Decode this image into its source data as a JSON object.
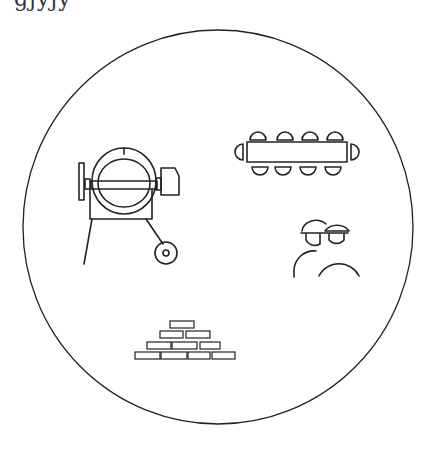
{
  "header": {
    "clipped_text": "gjyjy"
  },
  "diagram": {
    "frame": {
      "shape": "circle",
      "stroke": "#222222",
      "background": "#ffffff"
    },
    "icons": [
      {
        "id": "concrete-mixer",
        "name": "concrete-mixer-icon"
      },
      {
        "id": "meeting-table",
        "name": "conference-table-icon",
        "seats_top": 4,
        "seats_bottom": 4,
        "seats_ends": 2
      },
      {
        "id": "workers",
        "name": "workers-hardhat-icon",
        "count": 2
      },
      {
        "id": "bricks",
        "name": "brick-stack-icon",
        "rows": [
          1,
          2,
          3,
          4
        ]
      }
    ]
  }
}
